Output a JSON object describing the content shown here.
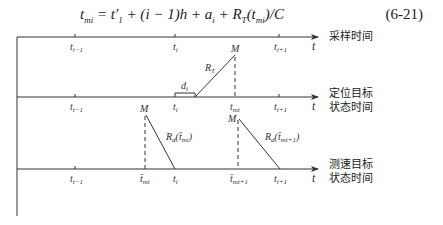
{
  "formula": {
    "text": "t_mi = t'_1 + (i − 1)h + a_i + R_T(t_mi)/C",
    "number": "(6-21)"
  },
  "axes": [
    {
      "name": "sampling-time",
      "label_lines": [
        "采样时间"
      ],
      "axis_var": "t",
      "ticks": [
        "t_{i-1}",
        "t_i",
        "t_{i+1}"
      ]
    },
    {
      "name": "positioning-target-state-time",
      "label_lines": [
        "定位目标",
        "状态时间"
      ],
      "axis_var": "t",
      "ticks": [
        "t_{i-1}",
        "t_i",
        "t_mi",
        "t_{i+1}"
      ],
      "annotations": {
        "point": "M",
        "range_label": "R_T",
        "delay_label": "d_i"
      }
    },
    {
      "name": "velocity-target-state-time",
      "label_lines": [
        "测速目标",
        "状态时间"
      ],
      "axis_var": "t",
      "ticks": [
        "t_{i-1}",
        "t̄_mi",
        "t_i",
        "t̄_{mi+1}",
        "t_{i+1}"
      ],
      "annotations": {
        "point": "M",
        "range_label_1": "R_d(t̄_mi)",
        "range_label_2": "R_d(t̄_mi+1)"
      }
    }
  ],
  "labels": {
    "axis1_cn": "采样时间",
    "axis2_cn_1": "定位目标",
    "axis2_cn_2": "状态时间",
    "axis3_cn_1": "测速目标",
    "axis3_cn_2": "状态时间",
    "t": "t",
    "M": "M",
    "RT": "R",
    "RT_sub": "T",
    "di": "d",
    "di_sub": "i",
    "Rd": "R",
    "Rd_sub": "d",
    "tmi_arg": "(t̄",
    "tmi_arg_sub": "mi",
    "tmi1_arg_sub": "mi+1",
    "close_paren": ")",
    "t_base": "t",
    "sub_im1": "i−1",
    "sub_i": "i",
    "sub_ip1": "i+1",
    "sub_mi": "mi",
    "sub_mi1": "mi+1",
    "tbar": "t̄"
  }
}
